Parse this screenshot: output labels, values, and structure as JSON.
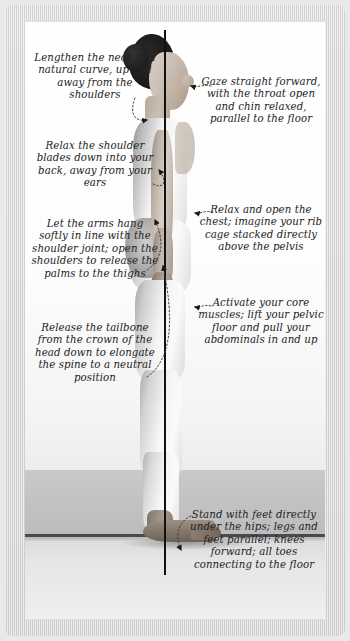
{
  "figure": {
    "plumb_line_label": "vertical-plumb-line"
  },
  "annotations": {
    "left": [
      {
        "id": "lengthen-neck",
        "text": "Lengthen the neck in a natural curve, up and away from the shoulders",
        "points_to": "neck"
      },
      {
        "id": "relax-shoulder-blades",
        "text": "Relax the shoulder blades down into your back, away from your ears",
        "points_to": "shoulder-blades"
      },
      {
        "id": "let-arms-hang",
        "text": "Let the arms hang softly in line with the shoulder joint; open the shoulders to release the palms to the thighs",
        "points_to": "arm"
      },
      {
        "id": "release-tailbone",
        "text": "Release the tailbone from the crown of the head down to elongate the spine to a neutral position",
        "points_to": "tailbone"
      }
    ],
    "right": [
      {
        "id": "gaze-straight-forward",
        "text": "Gaze straight forward, with the throat open and chin relaxed, parallel to the floor",
        "points_to": "face"
      },
      {
        "id": "relax-open-chest",
        "text": "Relax and open the chest; imagine your rib cage stacked directly above the pelvis",
        "points_to": "chest"
      },
      {
        "id": "activate-core",
        "text": "Activate your core muscles; lift your pelvic floor and pull your abdominals in and up",
        "points_to": "abdomen"
      },
      {
        "id": "stand-with-feet",
        "text": "Stand with feet directly under the hips; legs and feet parallel; knees forward; all toes connecting to the floor",
        "points_to": "feet"
      }
    ]
  },
  "colors": {
    "text": "#232323",
    "plumb_line": "#111111",
    "frame": "#d6d6d6",
    "plate": "#ffffff",
    "floor": "#c2c2c2",
    "floor_line": "#4a4a4a"
  }
}
